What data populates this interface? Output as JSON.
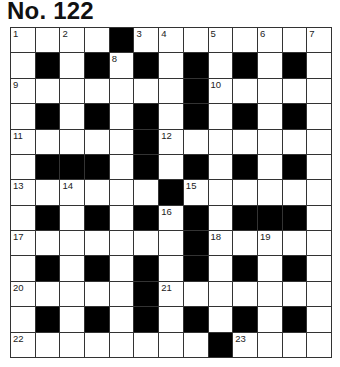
{
  "puzzle": {
    "title": "No. 122",
    "rows": 13,
    "cols": 13,
    "layout": [
      "####.########",
      "#.#.#.#.#.#.#",
      "#######.#####",
      "#.#.#.#.#.#.#",
      "#####.#######",
      "#...#.#.#.#.#",
      "######.######",
      "#.#.#.#.#...#",
      "#######.#####",
      "#.#.#.#.#.#.#",
      "#####.#######",
      "#.#.#.#.#.#.#",
      "########.####"
    ],
    "numbers": [
      {
        "n": "1",
        "r": 0,
        "c": 0
      },
      {
        "n": "2",
        "r": 0,
        "c": 2
      },
      {
        "n": "3",
        "r": 0,
        "c": 5
      },
      {
        "n": "4",
        "r": 0,
        "c": 6
      },
      {
        "n": "5",
        "r": 0,
        "c": 8
      },
      {
        "n": "6",
        "r": 0,
        "c": 10
      },
      {
        "n": "7",
        "r": 0,
        "c": 12
      },
      {
        "n": "8",
        "r": 1,
        "c": 4
      },
      {
        "n": "9",
        "r": 2,
        "c": 0
      },
      {
        "n": "10",
        "r": 2,
        "c": 8
      },
      {
        "n": "11",
        "r": 4,
        "c": 0
      },
      {
        "n": "12",
        "r": 4,
        "c": 6
      },
      {
        "n": "13",
        "r": 6,
        "c": 0
      },
      {
        "n": "14",
        "r": 6,
        "c": 2
      },
      {
        "n": "15",
        "r": 6,
        "c": 7
      },
      {
        "n": "16",
        "r": 7,
        "c": 6
      },
      {
        "n": "17",
        "r": 8,
        "c": 0
      },
      {
        "n": "18",
        "r": 8,
        "c": 8
      },
      {
        "n": "19",
        "r": 8,
        "c": 10
      },
      {
        "n": "20",
        "r": 10,
        "c": 0
      },
      {
        "n": "21",
        "r": 10,
        "c": 6
      },
      {
        "n": "22",
        "r": 12,
        "c": 0
      },
      {
        "n": "23",
        "r": 12,
        "c": 9
      }
    ],
    "colors": {
      "block": "#000000",
      "cell": "#ffffff",
      "line": "#333333"
    }
  }
}
